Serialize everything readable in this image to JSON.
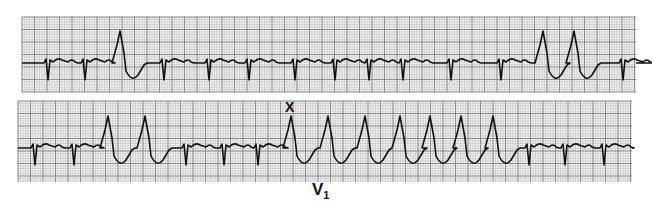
{
  "figure": {
    "type": "ecg-rhythm-strip",
    "lead_label": "V",
    "lead_label_sub": "1",
    "marker_symbol": "X",
    "colors": {
      "grid_minor": "#b8b8b8",
      "grid_major": "#6e6e6e",
      "trace": "#111111",
      "paper": "#f4f4f4"
    }
  },
  "strips": [
    {
      "name": "top-strip",
      "beats": [
        {
          "x": 46,
          "type": "narrow"
        },
        {
          "x": 83,
          "type": "narrow"
        },
        {
          "x": 120,
          "type": "wide"
        },
        {
          "x": 162,
          "type": "narrow"
        },
        {
          "x": 207,
          "type": "narrow"
        },
        {
          "x": 247,
          "type": "narrow"
        },
        {
          "x": 293,
          "type": "narrow"
        },
        {
          "x": 333,
          "type": "narrow"
        },
        {
          "x": 367,
          "type": "narrow"
        },
        {
          "x": 401,
          "type": "narrow"
        },
        {
          "x": 449,
          "type": "narrow"
        },
        {
          "x": 499,
          "type": "narrow"
        },
        {
          "x": 543,
          "type": "wide"
        },
        {
          "x": 574,
          "type": "wide"
        },
        {
          "x": 621,
          "type": "narrow"
        }
      ]
    },
    {
      "name": "bottom-strip",
      "beats": [
        {
          "x": 33,
          "type": "narrow"
        },
        {
          "x": 72,
          "type": "narrow"
        },
        {
          "x": 108,
          "type": "wide"
        },
        {
          "x": 145,
          "type": "wide"
        },
        {
          "x": 184,
          "type": "narrow"
        },
        {
          "x": 222,
          "type": "narrow"
        },
        {
          "x": 256,
          "type": "narrow"
        },
        {
          "x": 291,
          "type": "wide"
        },
        {
          "x": 328,
          "type": "wide"
        },
        {
          "x": 365,
          "type": "wide"
        },
        {
          "x": 400,
          "type": "wide"
        },
        {
          "x": 430,
          "type": "wide"
        },
        {
          "x": 461,
          "type": "wide"
        },
        {
          "x": 493,
          "type": "wide"
        },
        {
          "x": 527,
          "type": "narrow"
        },
        {
          "x": 563,
          "type": "narrow"
        },
        {
          "x": 602,
          "type": "narrow"
        }
      ]
    }
  ]
}
